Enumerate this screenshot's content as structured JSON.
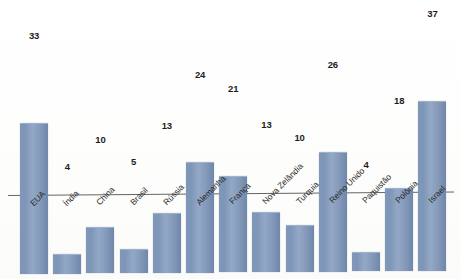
{
  "chart_data": {
    "type": "bar",
    "title": "",
    "subtitle": "",
    "xlabel": "",
    "ylabel": "",
    "ylim": [
      0,
      40
    ],
    "grid": false,
    "legend": false,
    "axis": {
      "y_axis_visible": false,
      "x_axis_visible": true,
      "tick_labels_rotated_deg": -45
    },
    "categories": [
      "EUA",
      "Índia",
      "China",
      "Brasil",
      "Rússia",
      "Alemanha",
      "França",
      "Nova Zelândia",
      "Turquia",
      "Reino Unido",
      "Paquistão",
      "Polônia",
      "Israel"
    ],
    "values": [
      33,
      4,
      10,
      5,
      13,
      24,
      21,
      13,
      10,
      26,
      4,
      18,
      37
    ],
    "data_labels": [
      "33",
      "4",
      "10",
      "5",
      "13",
      "24",
      "21",
      "13",
      "10",
      "26",
      "4",
      "18",
      "37"
    ],
    "colors": {
      "bar_fill": "#8097b8",
      "bar_edge": "#6f87ab",
      "axis_line": "#4a4a4a",
      "label_text": "#2b2b2b",
      "value_text": "#1d1d1d",
      "background": "#ffffff"
    }
  }
}
